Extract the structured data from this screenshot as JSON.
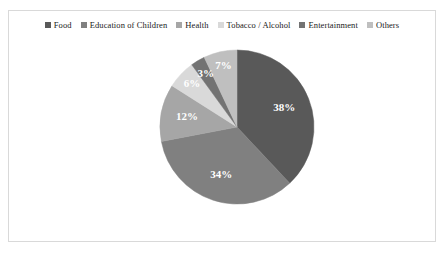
{
  "chart_data": {
    "type": "pie",
    "title": "",
    "categories": [
      "Food",
      "Education of Children",
      "Health",
      "Tobacco / Alcohol",
      "Entertainment",
      "Others"
    ],
    "values": [
      38,
      34,
      12,
      6,
      3,
      7
    ],
    "value_labels": [
      "38%",
      "34%",
      "12%",
      "6%",
      "3%",
      "7%"
    ],
    "unit": "%",
    "total": 100,
    "legend_position": "top",
    "start_angle_deg": 0,
    "direction": "clockwise",
    "colors": [
      "#595959",
      "#808080",
      "#a6a6a6",
      "#d9d9d9",
      "#737373",
      "#bfbfbf"
    ],
    "label_color": "#ffffff",
    "border_color": "#d9d9d9",
    "background": "#ffffff"
  },
  "legend": {
    "items": [
      {
        "label": "Food",
        "color": "#595959"
      },
      {
        "label": "Education of Children",
        "color": "#808080"
      },
      {
        "label": "Health",
        "color": "#a6a6a6"
      },
      {
        "label": "Tobacco / Alcohol",
        "color": "#d9d9d9"
      },
      {
        "label": "Entertainment",
        "color": "#737373"
      },
      {
        "label": "Others",
        "color": "#bfbfbf"
      }
    ]
  }
}
